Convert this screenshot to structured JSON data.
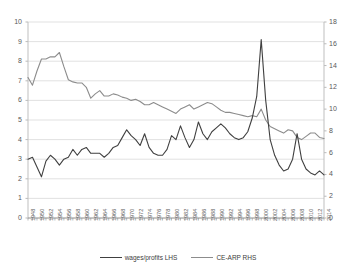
{
  "chart_data": {
    "type": "line",
    "title": "",
    "xlabel": "",
    "grid": "horizontal",
    "legend_position": "bottom",
    "x": [
      1948,
      1949,
      1950,
      1951,
      1952,
      1953,
      1954,
      1955,
      1956,
      1957,
      1958,
      1959,
      1960,
      1961,
      1962,
      1963,
      1964,
      1965,
      1966,
      1967,
      1968,
      1969,
      1970,
      1971,
      1972,
      1973,
      1974,
      1975,
      1976,
      1977,
      1978,
      1979,
      1980,
      1981,
      1982,
      1983,
      1984,
      1985,
      1986,
      1987,
      1988,
      1989,
      1990,
      1991,
      1992,
      1993,
      1994,
      1995,
      1996,
      1997,
      1998,
      1999,
      2000,
      2001,
      2002,
      2003,
      2004,
      2005,
      2006,
      2007,
      2008,
      2009,
      2010,
      2011,
      2012,
      2013,
      2014
    ],
    "xtick_labels": [
      "1948",
      "1950",
      "1952",
      "1954",
      "1956",
      "1958",
      "1960",
      "1962",
      "1964",
      "1966",
      "1968",
      "1970",
      "1972",
      "1974",
      "1976",
      "1978",
      "1980",
      "1982",
      "1984",
      "1986",
      "1988",
      "1990",
      "1992",
      "1994",
      "1996",
      "1998",
      "2000",
      "2002",
      "2004",
      "2006",
      "2008",
      "2010",
      "2012",
      "2014"
    ],
    "xtick_step_years": 2,
    "left_axis": {
      "label": "",
      "ylim": [
        0,
        10
      ],
      "ticks": [
        0,
        1,
        2,
        3,
        4,
        5,
        6,
        7,
        8,
        9,
        10
      ]
    },
    "right_axis": {
      "label": "",
      "ylim": [
        0,
        18
      ],
      "ticks": [
        0,
        2,
        4,
        6,
        8,
        10,
        12,
        14,
        16,
        18
      ]
    },
    "series": [
      {
        "name": "wages/profits LHS",
        "axis": "left",
        "color": "#404040",
        "values": [
          3.0,
          3.1,
          2.6,
          2.1,
          2.9,
          3.2,
          3.0,
          2.7,
          3.0,
          3.1,
          3.5,
          3.2,
          3.5,
          3.6,
          3.3,
          3.3,
          3.3,
          3.1,
          3.3,
          3.6,
          3.7,
          4.1,
          4.5,
          4.2,
          4.0,
          3.7,
          4.3,
          3.6,
          3.3,
          3.2,
          3.2,
          3.5,
          4.2,
          4.0,
          4.7,
          4.1,
          3.6,
          4.0,
          4.9,
          4.3,
          4.0,
          4.4,
          4.6,
          4.8,
          4.6,
          4.3,
          4.1,
          4.0,
          4.1,
          4.4,
          5.1,
          6.2,
          9.1,
          6.0,
          4.0,
          3.2,
          2.7,
          2.4,
          2.5,
          3.0,
          4.3,
          3.0,
          2.5,
          2.3,
          2.2,
          2.4,
          2.2
        ]
      },
      {
        "name": "CE-ARP RHS",
        "axis": "right",
        "color": "#8c8c8c",
        "values": [
          12.9,
          12.2,
          13.5,
          14.6,
          14.6,
          14.8,
          14.8,
          15.2,
          13.9,
          12.7,
          12.5,
          12.4,
          12.4,
          12.0,
          11.0,
          11.4,
          11.7,
          11.2,
          11.2,
          11.4,
          11.3,
          11.1,
          11.0,
          10.8,
          10.9,
          10.7,
          10.4,
          10.4,
          10.6,
          10.4,
          10.2,
          10.0,
          9.8,
          9.6,
          10.0,
          10.2,
          10.4,
          10.0,
          10.2,
          10.4,
          10.6,
          10.5,
          10.2,
          9.9,
          9.7,
          9.7,
          9.6,
          9.5,
          9.4,
          9.3,
          9.4,
          9.3,
          10.0,
          9.0,
          8.4,
          8.2,
          8.0,
          7.8,
          8.1,
          8.0,
          7.4,
          7.2,
          7.5,
          7.8,
          7.8,
          7.4,
          7.3
        ]
      }
    ]
  },
  "legend": {
    "items": [
      {
        "label": "wages/profits LHS",
        "color": "#404040"
      },
      {
        "label": "CE-ARP RHS",
        "color": "#8c8c8c"
      }
    ]
  }
}
